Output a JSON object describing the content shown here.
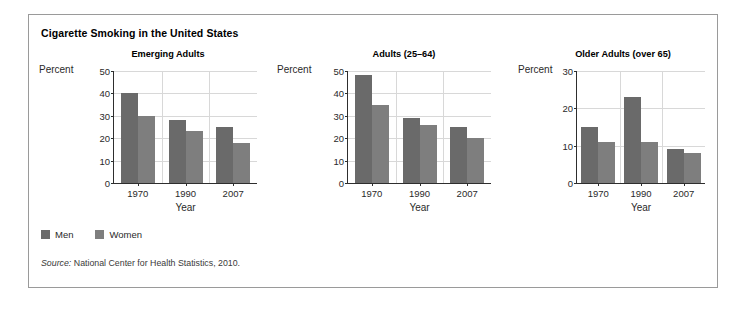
{
  "figure": {
    "title": "Cigarette Smoking in the United States",
    "source_word": "Source:",
    "source_text": "National Center for Health Statistics, 2010."
  },
  "legend": {
    "position": "bottom-left",
    "items": [
      {
        "label": "Men",
        "color": "#6a6a6a"
      },
      {
        "label": "Women",
        "color": "#7e7e7e"
      }
    ]
  },
  "chart_data": [
    {
      "type": "bar",
      "title": "Emerging Adults",
      "xlabel": "Year",
      "ylabel": "Percent",
      "categories": [
        "1970",
        "1990",
        "2007"
      ],
      "yticks": [
        0,
        10,
        20,
        30,
        40,
        50
      ],
      "ylim": [
        0,
        50
      ],
      "grid": true,
      "series": [
        {
          "name": "Men",
          "color": "#6a6a6a",
          "values": [
            40,
            28,
            25
          ]
        },
        {
          "name": "Women",
          "color": "#7e7e7e",
          "values": [
            30,
            23,
            18
          ]
        }
      ]
    },
    {
      "type": "bar",
      "title": "Adults (25–64)",
      "xlabel": "Year",
      "ylabel": "Percent",
      "categories": [
        "1970",
        "1990",
        "2007"
      ],
      "yticks": [
        0,
        10,
        20,
        30,
        40,
        50
      ],
      "ylim": [
        0,
        50
      ],
      "grid": true,
      "series": [
        {
          "name": "Men",
          "color": "#6a6a6a",
          "values": [
            48,
            29,
            25
          ]
        },
        {
          "name": "Women",
          "color": "#7e7e7e",
          "values": [
            35,
            26,
            20
          ]
        }
      ]
    },
    {
      "type": "bar",
      "title": "Older Adults (over 65)",
      "xlabel": "Year",
      "ylabel": "Percent",
      "categories": [
        "1970",
        "1990",
        "2007"
      ],
      "yticks": [
        0,
        10,
        20,
        30
      ],
      "ylim": [
        0,
        30
      ],
      "grid": true,
      "series": [
        {
          "name": "Men",
          "color": "#6a6a6a",
          "values": [
            15,
            23,
            9
          ]
        },
        {
          "name": "Women",
          "color": "#7e7e7e",
          "values": [
            11,
            11,
            8
          ]
        }
      ]
    }
  ]
}
